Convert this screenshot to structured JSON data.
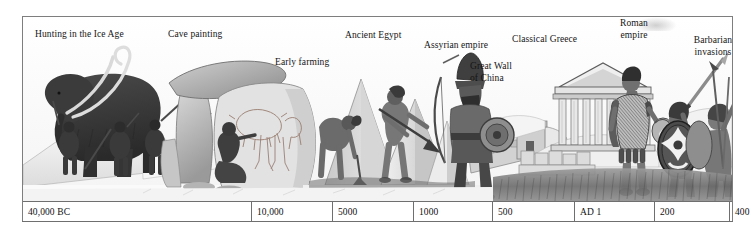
{
  "figure": {
    "kind": "historical-timeline-illustration",
    "palette": {
      "ink": "#1b1b1b",
      "rule": "#6f6f6f",
      "frame": "#7e7e7e",
      "paper": "#ffffff",
      "wash_light": "#e8e8e8",
      "wash_mid": "#b9b9b9",
      "wash_dark": "#6e6e6e",
      "shade_deep": "#3c3c3c"
    }
  },
  "scene_labels": [
    {
      "id": "hunting-ice-age",
      "text": "Hunting in the Ice Age",
      "x": 35,
      "y": 29,
      "align": "left",
      "width": 120
    },
    {
      "id": "cave-painting",
      "text": "Cave painting",
      "x": 168,
      "y": 29,
      "align": "left",
      "width": 80
    },
    {
      "id": "early-farming",
      "text": "Early farming",
      "x": 275,
      "y": 57,
      "align": "left",
      "width": 75
    },
    {
      "id": "ancient-egypt",
      "text": "Ancient Egypt",
      "x": 345,
      "y": 30,
      "align": "left",
      "width": 80
    },
    {
      "id": "assyrian-empire",
      "text": "Assyrian empire",
      "x": 424,
      "y": 40,
      "align": "left",
      "width": 86
    },
    {
      "id": "great-wall-china",
      "text": "Great Wall\nof China",
      "x": 470,
      "y": 61,
      "align": "left",
      "width": 62
    },
    {
      "id": "classical-greece",
      "text": "Classical Greece",
      "x": 512,
      "y": 34,
      "align": "left",
      "width": 88
    },
    {
      "id": "roman-empire",
      "text": "Roman\nempire",
      "x": 608,
      "y": 18,
      "align": "center",
      "width": 50
    },
    {
      "id": "barbarian-invasions",
      "text": "Barbarian\ninvasions",
      "x": 686,
      "y": 35,
      "align": "center",
      "width": 58
    }
  ],
  "chart_data": {
    "type": "table",
    "orientation": "horizontal",
    "direction": "past-to-present (left to right)",
    "axis_cells": [
      {
        "label": "40,000 BC",
        "era": "BC",
        "value": 40000,
        "left_px": 0,
        "width_px": 229
      },
      {
        "label": "10,000",
        "era": "BC",
        "value": 10000,
        "left_px": 229,
        "width_px": 81
      },
      {
        "label": "5000",
        "era": "BC",
        "value": 5000,
        "left_px": 310,
        "width_px": 81
      },
      {
        "label": "1000",
        "era": "BC",
        "value": 1000,
        "left_px": 391,
        "width_px": 79
      },
      {
        "label": "500",
        "era": "BC",
        "value": 500,
        "left_px": 470,
        "width_px": 82
      },
      {
        "label": "AD 1",
        "era": "AD",
        "value": 1,
        "left_px": 552,
        "width_px": 80
      },
      {
        "label": "200",
        "era": "AD",
        "value": 200,
        "left_px": 632,
        "width_px": 75
      },
      {
        "label": "400",
        "era": "AD",
        "value": 400,
        "left_px": 707,
        "width_px": 2
      }
    ],
    "events": [
      {
        "label": "Hunting in the Ice Age",
        "approx_date": "40,000 BC"
      },
      {
        "label": "Cave painting",
        "approx_date": "c. 15,000 BC"
      },
      {
        "label": "Early farming",
        "approx_date": "c. 8000 BC"
      },
      {
        "label": "Ancient Egypt",
        "approx_date": "c. 3000 BC"
      },
      {
        "label": "Assyrian empire",
        "approx_date": "c. 900 BC"
      },
      {
        "label": "Great Wall of China",
        "approx_date": "c. 220 BC"
      },
      {
        "label": "Classical Greece",
        "approx_date": "c. 480 BC"
      },
      {
        "label": "Roman empire",
        "approx_date": "c. AD 100"
      },
      {
        "label": "Barbarian invasions",
        "approx_date": "c. AD 400"
      }
    ]
  },
  "illustrations": [
    {
      "id": "mammoth-hunt",
      "name": "woolly mammoth with ice-age hunters and spears"
    },
    {
      "id": "cave-painting",
      "name": "megalithic cave with artist painting animals on rock"
    },
    {
      "id": "early-farmers",
      "name": "two farmers working the soil with hoe and digging stick"
    },
    {
      "id": "pyramids",
      "name": "egyptian pyramids on the horizon"
    },
    {
      "id": "assyrian-warrior",
      "name": "assyrian archer in conical helmet with bow and round shield"
    },
    {
      "id": "great-wall",
      "name": "great wall of china with watchtower"
    },
    {
      "id": "greek-temple",
      "name": "classical greek temple with columns and pediment"
    },
    {
      "id": "roman-soldier",
      "name": "roman legionary in scale armour holding helmet"
    },
    {
      "id": "barbarians",
      "name": "two barbarian warriors with oval shields, sword and spear"
    },
    {
      "id": "grass-foreground",
      "name": "grassy foreground strip"
    }
  ]
}
